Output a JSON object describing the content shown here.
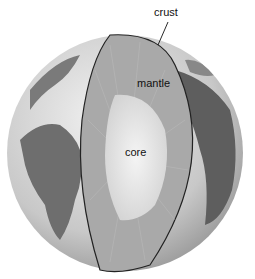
{
  "diagram": {
    "labels": {
      "crust": "crust",
      "mantle": "mantle",
      "core": "core"
    },
    "colors": {
      "ocean": "#d8d8d8",
      "land": "#6e6e6e",
      "mantle": "#a9a9a9",
      "core": "#e6e6e6",
      "outline": "#222222"
    }
  }
}
